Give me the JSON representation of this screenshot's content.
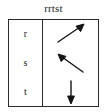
{
  "figure": {
    "title": "rrtst",
    "border_color": "#2b2b2b",
    "text_color": "#1a1a1a",
    "arrow_color": "#141414",
    "background": "#ffffff"
  },
  "table": {
    "columns": 2,
    "rows": [
      {
        "label": "r",
        "arrow": {
          "icon_name": "arrow-up-right-icon",
          "direction": "up-right",
          "angle_deg": 40
        }
      },
      {
        "label": "s",
        "arrow": {
          "icon_name": "arrow-up-left-icon",
          "direction": "up-left",
          "angle_deg": 141
        }
      },
      {
        "label": "t",
        "arrow": {
          "icon_name": "arrow-down-icon",
          "direction": "down",
          "angle_deg": 270
        }
      }
    ]
  }
}
